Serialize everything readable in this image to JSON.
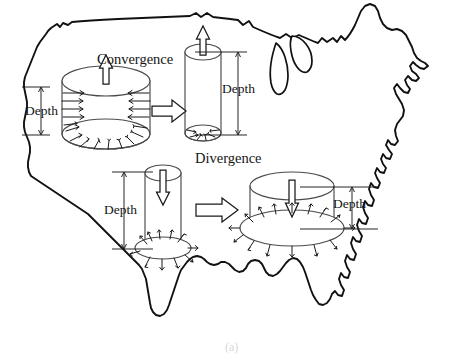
{
  "figure": {
    "caption": "(a)",
    "background_color": "#ffffff",
    "map": {
      "name": "united-states-outline",
      "stroke_color": "#111111",
      "fill_color": "#ffffff",
      "features": [
        "continental-us-outline",
        "great-lakes-michigan-huron"
      ]
    },
    "labels": {
      "convergence": "Convergence",
      "divergence": "Divergence",
      "depth": "Depth"
    },
    "process_arrow_color": "#1a1a1a",
    "cylinder_stroke_color": "#4a4a4a",
    "panels": [
      {
        "id": "panel-top-left",
        "name": "wide-short-cylinder-convergence",
        "shape": "wide-short-cylinder",
        "vertical_arrow_direction": "up",
        "vertical_arrow_label": "Convergence",
        "side_arrow_direction": "outward",
        "base_arrow_direction": "inward",
        "depth_label": "Depth",
        "depth_label_side": "left"
      },
      {
        "id": "panel-top-right",
        "name": "tall-narrow-cylinder-divergence",
        "shape": "tall-narrow-cylinder",
        "vertical_arrow_direction": "up",
        "base_arrow_direction": "inward",
        "caption_below": "Divergence",
        "depth_label": "Depth",
        "depth_label_side": "right"
      },
      {
        "id": "panel-bottom-left",
        "name": "tall-narrow-cylinder-downward",
        "shape": "tall-narrow-cylinder",
        "vertical_arrow_direction": "down",
        "base_arrow_direction": "outward",
        "depth_label": "Depth",
        "depth_label_side": "left"
      },
      {
        "id": "panel-bottom-right",
        "name": "wide-short-cylinder-downward",
        "shape": "wide-short-cylinder",
        "vertical_arrow_direction": "down",
        "base_arrow_direction": "outward",
        "depth_label": "Depth",
        "depth_label_side": "right"
      }
    ],
    "transitions": [
      {
        "id": "transition-top",
        "name": "top-row-transition-arrow",
        "direction": "right"
      },
      {
        "id": "transition-bottom",
        "name": "bottom-row-transition-arrow",
        "direction": "right"
      }
    ]
  }
}
